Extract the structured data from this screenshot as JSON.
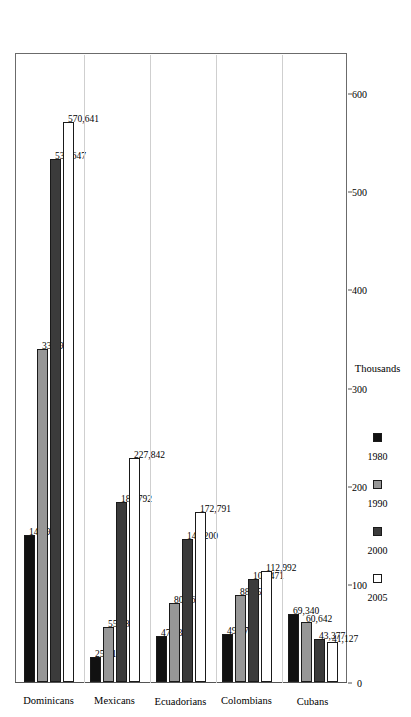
{
  "chart_data": {
    "type": "bar",
    "title": "",
    "subtitle": "",
    "xlabel": "",
    "ylabel": "Thousands",
    "orientation": "horizontal-rotated",
    "grid": false,
    "legend_position": "bottom",
    "axis_title": "Thousands",
    "axis_ticks": [
      "0",
      "100",
      "200",
      "300",
      "400",
      "500",
      "600"
    ],
    "axis_tick_values": [
      0,
      100,
      200,
      300,
      400,
      500,
      600
    ],
    "ylim": [
      0,
      640
    ],
    "categories": [
      "Dominicans",
      "Mexicans",
      "Ecuadorians",
      "Colombians",
      "Cubans"
    ],
    "series": [
      {
        "name": "1980",
        "color": "#111111",
        "values": [
          149947,
          25919,
          47330,
          49171,
          69340
        ],
        "labels": [
          "149,947",
          "25,919",
          "47,330",
          "49,171",
          "69,340"
        ]
      },
      {
        "name": "1990",
        "color": "#979797",
        "values": [
          338961,
          55587,
          80862,
          88259,
          60642
        ],
        "labels": [
          "338,961",
          "55,587",
          "80,862",
          "88,259",
          "60,642"
        ]
      },
      {
        "name": "2000",
        "color": "#3b3b3b",
        "values": [
          532647,
          183792,
          146200,
          105471,
          43377
        ],
        "labels": [
          "532,647",
          "183,792",
          "146,200",
          "105,471",
          "43,377"
        ]
      },
      {
        "name": "2005",
        "color": "#ffffff",
        "values": [
          570641,
          227842,
          172791,
          112992,
          41127
        ],
        "labels": [
          "570,641",
          "227,842",
          "172,791",
          "112,992",
          "41,127"
        ]
      }
    ],
    "legend": [
      {
        "label": "1980",
        "color": "#111111"
      },
      {
        "label": "1990",
        "color": "#979797"
      },
      {
        "label": "2000",
        "color": "#3b3b3b"
      },
      {
        "label": "2005",
        "color": "#ffffff"
      }
    ]
  }
}
